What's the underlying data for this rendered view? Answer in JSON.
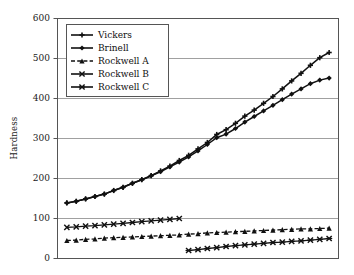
{
  "chart_data": {
    "type": "line",
    "title": "",
    "subtitle": "",
    "xlabel": "",
    "ylabel": "Hardness",
    "ylim": [
      0,
      600
    ],
    "xlim": [
      0,
      30
    ],
    "ytick_labels": [
      "0",
      "100",
      "200",
      "300",
      "400",
      "500",
      "600"
    ],
    "ytick_values": [
      0,
      100,
      200,
      300,
      400,
      500,
      600
    ],
    "xtick_labels": [],
    "grid": "horizontal",
    "legend_position": "top-left-inside",
    "series": [
      {
        "name": "Vickers",
        "marker": "plus",
        "line": "solid",
        "x": [
          1,
          2,
          3,
          4,
          5,
          6,
          7,
          8,
          9,
          10,
          11,
          12,
          13,
          14,
          15,
          16,
          17,
          18,
          19,
          20,
          21,
          22,
          23,
          24,
          25,
          26,
          27,
          28,
          29
        ],
        "values": [
          139,
          143,
          149,
          155,
          161,
          170,
          178,
          188,
          197,
          207,
          219,
          231,
          245,
          258,
          274,
          290,
          310,
          322,
          338,
          356,
          371,
          388,
          405,
          424,
          444,
          463,
          483,
          502,
          515
        ]
      },
      {
        "name": "Brinell",
        "marker": "diamond",
        "line": "solid",
        "x": [
          1,
          2,
          3,
          4,
          5,
          6,
          7,
          8,
          9,
          10,
          11,
          12,
          13,
          14,
          15,
          16,
          17,
          18,
          19,
          20,
          21,
          22,
          23,
          24,
          25,
          26,
          27,
          28,
          29
        ],
        "values": [
          139,
          143,
          149,
          155,
          161,
          170,
          178,
          188,
          197,
          207,
          217,
          229,
          241,
          254,
          269,
          285,
          302,
          311,
          325,
          341,
          355,
          369,
          383,
          397,
          411,
          424,
          437,
          446,
          451
        ]
      },
      {
        "name": "Rockwell A",
        "marker": "triangle",
        "line": "dashed",
        "x": [
          1,
          2,
          3,
          4,
          5,
          6,
          7,
          8,
          9,
          10,
          11,
          12,
          13,
          14,
          15,
          16,
          17,
          18,
          19,
          20,
          21,
          22,
          23,
          24,
          25,
          26,
          27,
          28,
          29
        ],
        "values": [
          45,
          46,
          48,
          49,
          51,
          52,
          53,
          54,
          55,
          56,
          57,
          58,
          59,
          61,
          62,
          64,
          65,
          66,
          67,
          68,
          69,
          70,
          71,
          72,
          73,
          74,
          74,
          75,
          76
        ]
      },
      {
        "name": "Rockwell B",
        "marker": "x",
        "line": "solid",
        "x": [
          1,
          2,
          3,
          4,
          5,
          6,
          7,
          8,
          9,
          10,
          11,
          12,
          13
        ],
        "values": [
          78,
          79,
          81,
          82,
          84,
          86,
          88,
          90,
          92,
          94,
          96,
          98,
          100
        ]
      },
      {
        "name": "Rockwell C",
        "marker": "x-bar",
        "line": "solid",
        "x": [
          14,
          15,
          16,
          17,
          18,
          19,
          20,
          21,
          22,
          23,
          24,
          25,
          26,
          27,
          28,
          29
        ],
        "values": [
          20,
          22,
          25,
          27,
          30,
          32,
          34,
          36,
          38,
          40,
          41,
          43,
          44,
          46,
          48,
          50
        ]
      }
    ],
    "colors": {
      "line": "#111111",
      "grid": "#888888",
      "frame": "#555555",
      "text": "#1a1a1a",
      "background": "#ffffff"
    }
  }
}
